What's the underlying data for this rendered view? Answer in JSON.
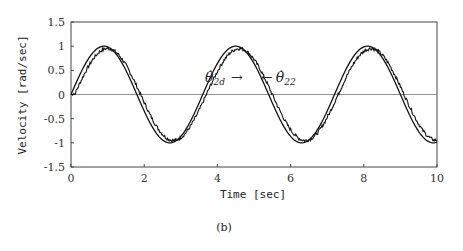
{
  "chart_data": {
    "type": "line",
    "title": "",
    "xlabel": "Time [sec]",
    "ylabel": "Velocity [rad/sec]",
    "xlim": [
      0,
      10
    ],
    "ylim": [
      -1.5,
      1.5
    ],
    "xticks": [
      "0",
      "2",
      "4",
      "6",
      "8",
      "10"
    ],
    "yticks": [
      "1.5",
      "1",
      "0.5",
      "0",
      "-0.5",
      "-1",
      "-1.5"
    ],
    "grid": false,
    "zero_line": true,
    "series": [
      {
        "name": "theta_dot_2d (desired)",
        "label_text": "θ̇2d",
        "style": "smooth",
        "amplitude": 1.0,
        "period": 3.6,
        "x": [
          0,
          0.9,
          1.8,
          2.7,
          3.6,
          4.5,
          5.4,
          6.3,
          7.2,
          8.1,
          9.0,
          9.9,
          10
        ],
        "y": [
          0,
          1.0,
          0,
          -1.0,
          0,
          1.0,
          0,
          -1.0,
          0,
          1.0,
          0,
          -1.0,
          -0.98
        ]
      },
      {
        "name": "theta_dot_22 (measured)",
        "label_text": "θ̇22",
        "style": "noisy",
        "amplitude": 0.95,
        "lag": 0.1,
        "x": [
          0,
          1.0,
          1.9,
          2.8,
          3.7,
          4.6,
          5.5,
          6.4,
          7.3,
          8.2,
          9.1,
          10
        ],
        "y": [
          0,
          0.95,
          0,
          -0.95,
          0,
          0.95,
          0,
          -0.95,
          0,
          0.95,
          0,
          -0.92
        ]
      }
    ],
    "annotations": [
      {
        "text": "θ̇2d →",
        "x": 3.0,
        "y": 0.45
      },
      {
        "text": "← θ̇22",
        "x": 4.0,
        "y": 0.45
      }
    ]
  },
  "caption": "(b)",
  "ann": {
    "left_main": "θ̇",
    "left_sub": "2d",
    "left_arrow": "→",
    "right_arrow": "←",
    "right_main": "θ̇",
    "right_sub": "22"
  }
}
